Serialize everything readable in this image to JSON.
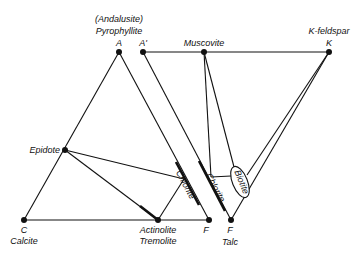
{
  "diagram": {
    "type": "phase-compatibility-diagram",
    "left_triangle": {
      "vertices": {
        "A": {
          "letter": "A",
          "name": "Pyrophyllite",
          "alt_name": "(Andalusite)"
        },
        "C": {
          "letter": "C",
          "name": "Calcite"
        },
        "F": {
          "letter": "F"
        }
      },
      "phases": {
        "epidote": "Epidote",
        "actinolite": "Actinolite",
        "tremolite": "Tremolite",
        "chlorite": "Chlorite"
      }
    },
    "right_triangle": {
      "vertices": {
        "A_prime": {
          "letter": "A'"
        },
        "K": {
          "letter": "K",
          "name": "K-feldspar"
        },
        "F": {
          "letter": "F",
          "name": "Talc"
        }
      },
      "phases": {
        "muscovite": "Muscovite",
        "chlorite": "Chlorite",
        "biotite": "Biotite"
      }
    },
    "colors": {
      "line": "#111111",
      "background": "#ffffff"
    }
  }
}
